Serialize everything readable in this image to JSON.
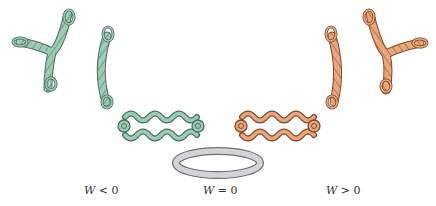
{
  "figure": {
    "colors": {
      "negative_fill": "#9ccbb6",
      "negative_stroke": "#4a6e60",
      "positive_fill": "#eba77a",
      "positive_stroke": "#7a4a2e",
      "relaxed_fill": "#d4d4d8",
      "relaxed_stroke": "#6f6f75"
    },
    "labels": {
      "negative": {
        "var": "W",
        "rel": "<",
        "val": "0"
      },
      "relaxed": {
        "var": "W",
        "rel": "=",
        "val": "0"
      },
      "positive": {
        "var": "W",
        "rel": ">",
        "val": "0"
      }
    }
  }
}
